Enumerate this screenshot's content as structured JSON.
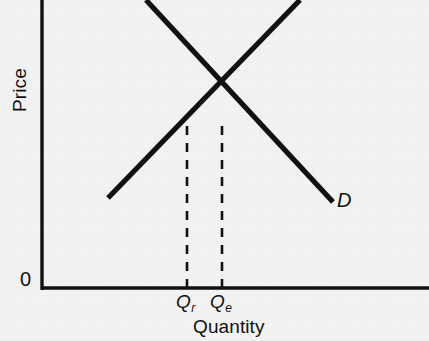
{
  "figure": {
    "background_color": "#f2f2f2",
    "ink_color": "#111111",
    "width": 429,
    "height": 341
  },
  "axes": {
    "y_title": "Price",
    "x_title": "Quantity",
    "origin_label": "0",
    "y_axis": {
      "x": 42,
      "y_top": 0,
      "y_bottom": 290,
      "stroke_width": 3.4
    },
    "x_axis": {
      "y": 288,
      "x_left": 42,
      "x_right": 429,
      "stroke_width": 3.4
    }
  },
  "curves": {
    "demand": {
      "label": "D",
      "x1": 146,
      "y1": 0,
      "x2": 333,
      "y2": 202,
      "stroke_width": 5.2
    },
    "supply": {
      "label": "",
      "x1": 108,
      "y1": 198,
      "x2": 300,
      "y2": 0,
      "stroke_width": 5.2
    }
  },
  "equilibrium": {
    "x": 223,
    "y": 92
  },
  "guides": [
    {
      "name": "qr",
      "label_q": "Q",
      "label_sub": "r",
      "x": 187,
      "y_top": 126,
      "y_bottom": 288,
      "stroke_width": 2.6,
      "dash": "9 8"
    },
    {
      "name": "qe",
      "label_q": "Q",
      "label_sub": "e",
      "x": 222,
      "y_top": 126,
      "y_bottom": 288,
      "stroke_width": 2.6,
      "dash": "9 8"
    }
  ],
  "chart_data": {
    "type": "line",
    "title": "",
    "subtitle": "",
    "xlabel": "Quantity",
    "ylabel": "Price",
    "xlim": [
      0,
      429
    ],
    "ylim": [
      0,
      341
    ],
    "grid": false,
    "legend": "inline-curve-labels",
    "axis_tick_labels": {
      "x": [
        "Qr",
        "Qe"
      ],
      "y": [
        "0"
      ]
    },
    "series": [
      {
        "name": "Demand",
        "label": "D",
        "slope": "negative",
        "points": [
          [
            146,
            0
          ],
          [
            333,
            202
          ]
        ]
      },
      {
        "name": "Supply",
        "label": "",
        "slope": "positive",
        "points": [
          [
            108,
            198
          ],
          [
            300,
            0
          ]
        ]
      }
    ],
    "annotations": [
      {
        "text": "Q_r",
        "type": "x-tick",
        "x": 187
      },
      {
        "text": "Q_e",
        "type": "x-tick",
        "x": 222
      },
      {
        "text": "D",
        "type": "curve-label",
        "x": 337,
        "y": 202
      },
      {
        "text": "equilibrium",
        "type": "intersection",
        "x": 223,
        "y": 92
      }
    ]
  }
}
